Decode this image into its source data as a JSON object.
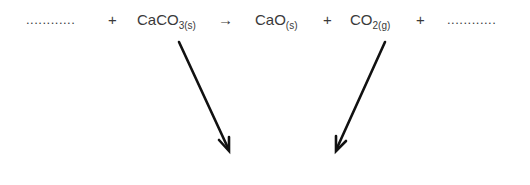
{
  "equation": {
    "blank_left": "............",
    "plus_1": "+",
    "reactant": {
      "formula": "CaCO",
      "subscript": "3(s)"
    },
    "yields": "→",
    "product_1": {
      "formula": "CaO",
      "subscript": "(s)"
    },
    "plus_2": "+",
    "product_2": {
      "formula": "CO",
      "subscript": "2(g)"
    },
    "plus_3": "+",
    "blank_right": "............"
  },
  "arrows": [
    {
      "from": "CaCO3(s)",
      "direction": "down-right"
    },
    {
      "from": "CO2(g)",
      "direction": "down-left"
    }
  ],
  "colors": {
    "text": "#3a3a3a",
    "arrow": "#111111"
  }
}
